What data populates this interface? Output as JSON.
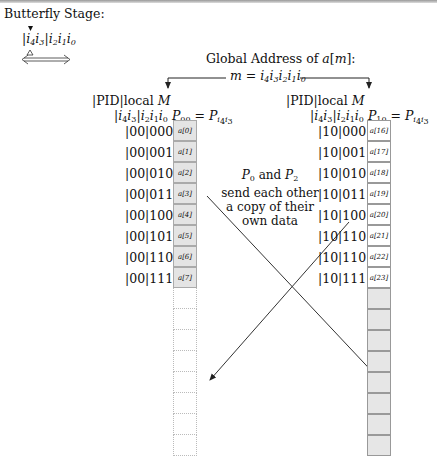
{
  "title": "Butterfly Stage:",
  "index_pattern": {
    "pid_bits": "i4i3",
    "local_bits": "i2i1i0",
    "marker_top": "filled-triangle-down",
    "marker_bottom": "hollow-triangle-up",
    "swap_arrow": "double-headed-arrow"
  },
  "global_address": {
    "line1": "Global Address of a[m]:",
    "line2": "m = i4i3i2i1i0"
  },
  "left_processor": {
    "header1": "|PID|local M",
    "header2_bits": "|i4i3|i2i1i0",
    "header2_proc": "P00 = Pi4i3",
    "rows": [
      {
        "addr": "|00|000",
        "cell": "a[0]"
      },
      {
        "addr": "|00|001",
        "cell": "a[1]"
      },
      {
        "addr": "|00|010",
        "cell": "a[2]"
      },
      {
        "addr": "|00|011",
        "cell": "a[3]"
      },
      {
        "addr": "|00|100",
        "cell": "a[4]"
      },
      {
        "addr": "|00|101",
        "cell": "a[5]"
      },
      {
        "addr": "|00|110",
        "cell": "a[6]"
      },
      {
        "addr": "|00|111",
        "cell": "a[7]"
      }
    ],
    "empty_slots": 8,
    "fill_color": "#e4e4e4"
  },
  "right_processor": {
    "header1": "|PID|local M",
    "header2_bits": "|i4i3|i2i1i0",
    "header2_proc": "P10 = Pi4i3",
    "rows": [
      {
        "addr": "|10|000",
        "cell": "a[16]"
      },
      {
        "addr": "|10|001",
        "cell": "a[17]"
      },
      {
        "addr": "|10|010",
        "cell": "a[18]"
      },
      {
        "addr": "|10|011",
        "cell": "a[19]"
      },
      {
        "addr": "|10|100",
        "cell": "a[20]"
      },
      {
        "addr": "|10|110",
        "cell": "a[21]"
      },
      {
        "addr": "|10|110",
        "cell": "a[22]"
      },
      {
        "addr": "|10|111",
        "cell": "a[23]"
      }
    ],
    "empty_slots": 8,
    "fill_color": "#e6e6e6"
  },
  "exchange_note": {
    "line1": "P0 and P2",
    "line2": "send each other",
    "line3": "a copy of their",
    "line4": "own data"
  }
}
